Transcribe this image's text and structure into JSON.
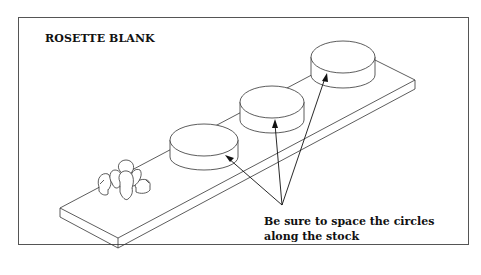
{
  "diagram": {
    "title": "ROSETTE BLANK",
    "note": {
      "line1": "Be sure to space the circles",
      "line2": "along the stock"
    },
    "elements": {
      "board": "wood-stock-board",
      "rosette": "carved-rosette",
      "cylinders": [
        "circle-blank-1",
        "circle-blank-2",
        "circle-blank-3"
      ],
      "arrows": 3
    },
    "colors": {
      "line": "#333333",
      "background": "#ffffff",
      "frame": "#555555"
    }
  }
}
